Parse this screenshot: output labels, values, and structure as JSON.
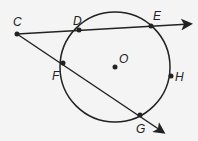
{
  "diagram": {
    "circle": {
      "center_label": "O",
      "cx": 115,
      "cy": 67,
      "r": 55
    },
    "points": [
      {
        "label": "C",
        "x": 17,
        "y": 34,
        "lx": 13,
        "ly": 26
      },
      {
        "label": "D",
        "x": 79,
        "y": 30,
        "lx": 73,
        "ly": 25
      },
      {
        "label": "E",
        "x": 151,
        "y": 26,
        "lx": 153,
        "ly": 20
      },
      {
        "label": "F",
        "x": 63,
        "y": 63,
        "lx": 52,
        "ly": 80
      },
      {
        "label": "G",
        "x": 140,
        "y": 115,
        "lx": 136,
        "ly": 133
      },
      {
        "label": "H",
        "x": 171,
        "y": 76,
        "lx": 175,
        "ly": 81
      },
      {
        "label": "O",
        "x": 115,
        "y": 67,
        "lx": 119,
        "ly": 63
      }
    ],
    "rays": [
      {
        "from": "C",
        "through": [
          "D",
          "E"
        ]
      },
      {
        "from": "C",
        "through": [
          "F",
          "G"
        ]
      }
    ],
    "colors": {
      "line": "#222222",
      "background": "#f4f4f4"
    }
  }
}
